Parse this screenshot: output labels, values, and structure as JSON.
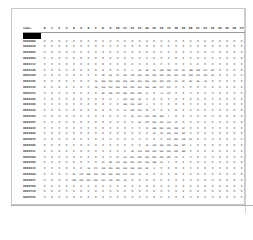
{
  "table": {
    "corner_label": "index",
    "selected_row_label": "",
    "columns": [
      "0",
      "1",
      "2",
      "3",
      "4",
      "5",
      "6",
      "7",
      "8",
      "9",
      "10",
      "11",
      "12",
      "13",
      "14",
      "15",
      "16",
      "17",
      "18",
      "19",
      "20",
      "21",
      "22",
      "23",
      "24",
      "25",
      "26",
      "27"
    ],
    "rows": [
      {
        "label": "0000000",
        "values": [
          0,
          0,
          0,
          0,
          0,
          0,
          0,
          0,
          0,
          0,
          0,
          0,
          0,
          0,
          0,
          0,
          0,
          0,
          0,
          0,
          0,
          0,
          0,
          0,
          0,
          0,
          0,
          0
        ]
      },
      {
        "label": "0000028",
        "values": [
          0,
          0,
          0,
          0,
          0,
          0,
          0,
          0,
          0,
          0,
          0,
          0,
          0,
          0,
          0,
          0,
          0,
          0,
          0,
          0,
          0,
          0,
          0,
          0,
          0,
          0,
          0,
          0
        ]
      },
      {
        "label": "0000056",
        "values": [
          0,
          0,
          0,
          0,
          0,
          0,
          0,
          0,
          0,
          0,
          0,
          0,
          0,
          0,
          0,
          0,
          0,
          0,
          0,
          0,
          0,
          0,
          0,
          0,
          0,
          0,
          0,
          0
        ]
      },
      {
        "label": "0000084",
        "values": [
          0,
          0,
          0,
          0,
          0,
          0,
          0,
          0,
          0,
          0,
          0,
          0,
          0,
          0,
          0,
          0,
          0,
          0,
          0,
          0,
          0,
          0,
          0,
          0,
          0,
          0,
          0,
          0
        ]
      },
      {
        "label": "0000112",
        "values": [
          0,
          0,
          0,
          0,
          0,
          0,
          0,
          0,
          0,
          0,
          0,
          0,
          0,
          0,
          0,
          0,
          0,
          0,
          0,
          0,
          0,
          0,
          0,
          0,
          0,
          0,
          0,
          0
        ]
      },
      {
        "label": "0000140",
        "values": [
          0,
          0,
          0,
          0,
          0,
          0,
          0,
          0,
          0,
          0,
          0,
          0,
          3,
          18,
          18,
          18,
          126,
          136,
          175,
          26,
          166,
          255,
          247,
          127,
          0,
          0,
          0,
          0
        ]
      },
      {
        "label": "0000168",
        "values": [
          0,
          0,
          0,
          0,
          0,
          0,
          0,
          0,
          30,
          36,
          94,
          154,
          170,
          253,
          253,
          253,
          253,
          253,
          225,
          172,
          253,
          242,
          195,
          64,
          0,
          0,
          0,
          0
        ]
      },
      {
        "label": "0000196",
        "values": [
          0,
          0,
          0,
          0,
          0,
          0,
          0,
          49,
          238,
          253,
          253,
          253,
          253,
          253,
          253,
          253,
          253,
          251,
          93,
          82,
          82,
          56,
          39,
          0,
          0,
          0,
          0,
          0
        ]
      },
      {
        "label": "0000224",
        "values": [
          0,
          0,
          0,
          0,
          0,
          0,
          0,
          18,
          219,
          253,
          253,
          253,
          253,
          253,
          198,
          182,
          247,
          241,
          0,
          0,
          0,
          0,
          0,
          0,
          0,
          0,
          0,
          0
        ]
      },
      {
        "label": "0000252",
        "values": [
          0,
          0,
          0,
          0,
          0,
          0,
          0,
          0,
          80,
          156,
          107,
          253,
          253,
          205,
          11,
          0,
          43,
          154,
          0,
          0,
          0,
          0,
          0,
          0,
          0,
          0,
          0,
          0
        ]
      },
      {
        "label": "0000280",
        "values": [
          0,
          0,
          0,
          0,
          0,
          0,
          0,
          0,
          0,
          14,
          1,
          154,
          253,
          90,
          0,
          0,
          0,
          0,
          0,
          0,
          0,
          0,
          0,
          0,
          0,
          0,
          0,
          0
        ]
      },
      {
        "label": "0000308",
        "values": [
          0,
          0,
          0,
          0,
          0,
          0,
          0,
          0,
          0,
          0,
          0,
          139,
          253,
          190,
          2,
          0,
          0,
          0,
          0,
          0,
          0,
          0,
          0,
          0,
          0,
          0,
          0,
          0
        ]
      },
      {
        "label": "0000336",
        "values": [
          0,
          0,
          0,
          0,
          0,
          0,
          0,
          0,
          0,
          0,
          0,
          11,
          190,
          253,
          70,
          0,
          0,
          0,
          0,
          0,
          0,
          0,
          0,
          0,
          0,
          0,
          0,
          0
        ]
      },
      {
        "label": "0000364",
        "values": [
          0,
          0,
          0,
          0,
          0,
          0,
          0,
          0,
          0,
          0,
          0,
          0,
          35,
          241,
          225,
          160,
          108,
          1,
          0,
          0,
          0,
          0,
          0,
          0,
          0,
          0,
          0,
          0
        ]
      },
      {
        "label": "0000392",
        "values": [
          0,
          0,
          0,
          0,
          0,
          0,
          0,
          0,
          0,
          0,
          0,
          0,
          0,
          81,
          240,
          253,
          253,
          119,
          25,
          0,
          0,
          0,
          0,
          0,
          0,
          0,
          0,
          0
        ]
      },
      {
        "label": "0000420",
        "values": [
          0,
          0,
          0,
          0,
          0,
          0,
          0,
          0,
          0,
          0,
          0,
          0,
          0,
          0,
          45,
          186,
          253,
          253,
          150,
          27,
          0,
          0,
          0,
          0,
          0,
          0,
          0,
          0
        ]
      },
      {
        "label": "0000448",
        "values": [
          0,
          0,
          0,
          0,
          0,
          0,
          0,
          0,
          0,
          0,
          0,
          0,
          0,
          0,
          0,
          16,
          93,
          252,
          253,
          187,
          0,
          0,
          0,
          0,
          0,
          0,
          0,
          0
        ]
      },
      {
        "label": "0000476",
        "values": [
          0,
          0,
          0,
          0,
          0,
          0,
          0,
          0,
          0,
          0,
          0,
          0,
          0,
          0,
          0,
          0,
          0,
          249,
          253,
          249,
          64,
          0,
          0,
          0,
          0,
          0,
          0,
          0
        ]
      },
      {
        "label": "0000504",
        "values": [
          0,
          0,
          0,
          0,
          0,
          0,
          0,
          0,
          0,
          0,
          0,
          0,
          0,
          0,
          46,
          130,
          183,
          253,
          253,
          207,
          2,
          0,
          0,
          0,
          0,
          0,
          0,
          0
        ]
      },
      {
        "label": "0000532",
        "values": [
          0,
          0,
          0,
          0,
          0,
          0,
          0,
          0,
          0,
          0,
          0,
          0,
          39,
          148,
          229,
          253,
          253,
          253,
          250,
          182,
          0,
          0,
          0,
          0,
          0,
          0,
          0,
          0
        ]
      },
      {
        "label": "0000560",
        "values": [
          0,
          0,
          0,
          0,
          0,
          0,
          0,
          0,
          0,
          0,
          24,
          114,
          221,
          253,
          253,
          253,
          253,
          201,
          78,
          0,
          0,
          0,
          0,
          0,
          0,
          0,
          0,
          0
        ]
      },
      {
        "label": "0000588",
        "values": [
          0,
          0,
          0,
          0,
          0,
          0,
          0,
          0,
          23,
          66,
          213,
          253,
          253,
          253,
          253,
          198,
          81,
          2,
          0,
          0,
          0,
          0,
          0,
          0,
          0,
          0,
          0,
          0
        ]
      },
      {
        "label": "0000616",
        "values": [
          0,
          0,
          0,
          0,
          0,
          0,
          18,
          171,
          219,
          253,
          253,
          253,
          253,
          195,
          80,
          9,
          0,
          0,
          0,
          0,
          0,
          0,
          0,
          0,
          0,
          0,
          0,
          0
        ]
      },
      {
        "label": "0000644",
        "values": [
          0,
          0,
          0,
          0,
          55,
          172,
          226,
          253,
          253,
          253,
          253,
          244,
          133,
          11,
          0,
          0,
          0,
          0,
          0,
          0,
          0,
          0,
          0,
          0,
          0,
          0,
          0,
          0
        ]
      },
      {
        "label": "0000672",
        "values": [
          0,
          0,
          0,
          0,
          136,
          253,
          253,
          253,
          212,
          135,
          132,
          16,
          0,
          0,
          0,
          0,
          0,
          0,
          0,
          0,
          0,
          0,
          0,
          0,
          0,
          0,
          0,
          0
        ]
      },
      {
        "label": "0000700",
        "values": [
          0,
          0,
          0,
          0,
          0,
          0,
          0,
          0,
          0,
          0,
          0,
          0,
          0,
          0,
          0,
          0,
          0,
          0,
          0,
          0,
          0,
          0,
          0,
          0,
          0,
          0,
          0,
          0
        ]
      },
      {
        "label": "0000728",
        "values": [
          0,
          0,
          0,
          0,
          0,
          0,
          0,
          0,
          0,
          0,
          0,
          0,
          0,
          0,
          0,
          0,
          0,
          0,
          0,
          0,
          0,
          0,
          0,
          0,
          0,
          0,
          0,
          0
        ]
      },
      {
        "label": "0000756",
        "values": [
          0,
          0,
          0,
          0,
          0,
          0,
          0,
          0,
          0,
          0,
          0,
          0,
          0,
          0,
          0,
          0,
          0,
          0,
          0,
          0,
          0,
          0,
          0,
          0,
          0,
          0,
          0,
          0
        ]
      }
    ]
  }
}
